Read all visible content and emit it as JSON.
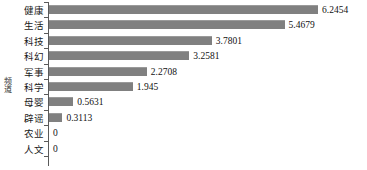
{
  "chart_data": {
    "type": "bar",
    "orientation": "horizontal",
    "title": "",
    "xlabel": "",
    "ylabel": "频道",
    "categories": [
      "健康",
      "生活",
      "科技",
      "科幻",
      "军事",
      "科学",
      "母婴",
      "辟谣",
      "农业",
      "人文"
    ],
    "values": [
      6.2454,
      5.4679,
      3.7801,
      3.2581,
      2.2708,
      1.945,
      0.5631,
      0.3113,
      0,
      0
    ],
    "value_labels": [
      "6.2454",
      "5.4679",
      "3.7801",
      "3.2581",
      "2.2708",
      "1.945",
      "0.5631",
      "0.3113",
      "0",
      "0"
    ],
    "xlim": [
      0,
      6.2454
    ],
    "grid": false,
    "legend": false,
    "bar_color": "#808080",
    "axis_color": "#5a5a5a",
    "text_color": "#111111",
    "background": "#ffffff"
  },
  "axis": {
    "vertical_title": "频道"
  }
}
